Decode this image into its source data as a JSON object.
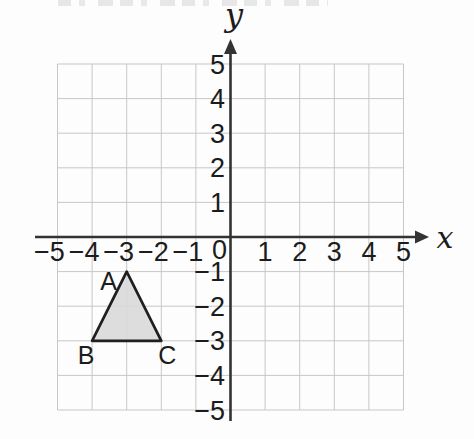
{
  "figure": {
    "background": "#fdfdfd",
    "grid_color": "#c7c7c7",
    "axis_color": "#333333",
    "text_color": "#1c1c1c",
    "shape_fill": "#d9d9d9",
    "shape_stroke": "#1f1f1f"
  },
  "chart_data": {
    "type": "scatter",
    "subtype": "coordinate-plane-with-polygon",
    "xlabel": "x",
    "ylabel": "y",
    "xlim": [
      -5,
      5
    ],
    "ylim": [
      -5,
      5
    ],
    "grid": true,
    "x_ticks": [
      -5,
      -4,
      -3,
      -2,
      -1,
      1,
      2,
      3,
      4,
      5
    ],
    "y_ticks": [
      -5,
      -4,
      -3,
      -2,
      -1,
      1,
      2,
      3,
      4,
      5
    ],
    "origin_label": "0",
    "series": [
      {
        "name": "triangle ABC",
        "shape": "polygon",
        "closed": true,
        "points": [
          {
            "label": "A",
            "x": -3,
            "y": -1,
            "label_placement": "upper-left"
          },
          {
            "label": "B",
            "x": -4,
            "y": -3,
            "label_placement": "below-left"
          },
          {
            "label": "C",
            "x": -2,
            "y": -3,
            "label_placement": "below-right"
          }
        ]
      }
    ]
  }
}
